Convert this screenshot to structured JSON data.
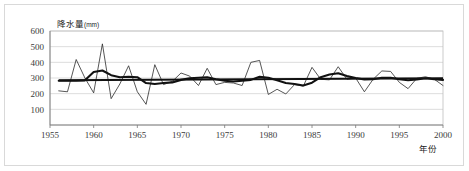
{
  "chart_data": {
    "type": "line",
    "title": "",
    "ylabel": "降水量",
    "ylabel_unit": "(mm)",
    "xlabel": "年份",
    "xlim": [
      1955,
      2000
    ],
    "ylim": [
      0,
      600
    ],
    "ytick_labels": [
      "600",
      "500",
      "400",
      "300",
      "200",
      "100"
    ],
    "ytick_values": [
      600,
      500,
      400,
      300,
      200,
      100
    ],
    "xtick_labels": [
      "1955",
      "1960",
      "1965",
      "1970",
      "1975",
      "1980",
      "1985",
      "1990",
      "1995",
      "2000"
    ],
    "xtick_values": [
      1955,
      1960,
      1965,
      1970,
      1975,
      1980,
      1985,
      1990,
      1995,
      2000
    ],
    "grid": true,
    "legend": "none",
    "x": [
      1956,
      1957,
      1958,
      1959,
      1960,
      1961,
      1962,
      1963,
      1964,
      1965,
      1966,
      1967,
      1968,
      1969,
      1970,
      1971,
      1972,
      1973,
      1974,
      1975,
      1976,
      1977,
      1978,
      1979,
      1980,
      1981,
      1982,
      1983,
      1984,
      1985,
      1986,
      1987,
      1988,
      1989,
      1990,
      1991,
      1992,
      1993,
      1994,
      1995,
      1996,
      1997,
      1998,
      1999,
      2000
    ],
    "series": [
      {
        "name": "年降水量",
        "style": "thin-line",
        "values": [
          218,
          212,
          418,
          300,
          205,
          518,
          168,
          262,
          378,
          212,
          132,
          385,
          258,
          278,
          332,
          312,
          252,
          362,
          258,
          272,
          268,
          252,
          400,
          412,
          195,
          228,
          198,
          258,
          248,
          368,
          292,
          288,
          372,
          292,
          300,
          212,
          292,
          345,
          342,
          272,
          232,
          298,
          308,
          292,
          252
        ]
      },
      {
        "name": "滑动平均",
        "style": "thick-line",
        "values": [
          282,
          282,
          282,
          285,
          338,
          348,
          318,
          305,
          308,
          305,
          268,
          262,
          268,
          272,
          288,
          298,
          302,
          305,
          292,
          282,
          278,
          282,
          288,
          308,
          302,
          285,
          268,
          262,
          252,
          270,
          305,
          322,
          330,
          312,
          300,
          290,
          292,
          302,
          302,
          292,
          286,
          290,
          298,
          292,
          288
        ]
      },
      {
        "name": "线性趋势",
        "style": "straight-trend",
        "values": [
          285,
          285.3,
          285.6,
          285.9,
          286.2,
          286.5,
          286.8,
          287.1,
          287.4,
          287.7,
          288,
          288.3,
          288.6,
          288.9,
          289.2,
          289.5,
          289.8,
          290.1,
          290.4,
          290.7,
          291,
          291.3,
          291.6,
          291.9,
          292.2,
          292.5,
          292.8,
          293.1,
          293.4,
          293.7,
          294,
          294.3,
          294.6,
          294.9,
          295.2,
          295.5,
          295.8,
          296.1,
          296.4,
          296.7,
          297,
          297.3,
          297.6,
          297.9,
          298.2
        ]
      }
    ]
  }
}
